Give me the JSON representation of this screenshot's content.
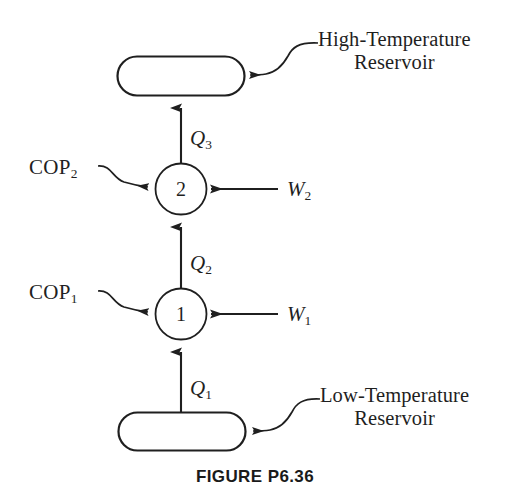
{
  "figure": {
    "caption": "FIGURE P6.36",
    "type": "thermodynamic-cycle-diagram",
    "background_color": "#ffffff",
    "line_color": "#1f1f1f"
  },
  "reservoirs": {
    "high": {
      "name": "high-temperature-reservoir",
      "line1": "High-Temperature",
      "line2": "Reservoir",
      "shape": "stadium"
    },
    "low": {
      "name": "low-temperature-reservoir",
      "line1": "Low-Temperature",
      "line2": "Reservoir",
      "shape": "stadium"
    }
  },
  "devices": [
    {
      "id": "device-2",
      "number": "2",
      "cop_prefix": "COP",
      "cop_sub": "2",
      "work_prefix": "W",
      "work_sub": "2"
    },
    {
      "id": "device-1",
      "number": "1",
      "cop_prefix": "COP",
      "cop_sub": "1",
      "work_prefix": "W",
      "work_sub": "1"
    }
  ],
  "heat_flows": [
    {
      "id": "q3",
      "prefix": "Q",
      "sub": "3",
      "from": "device-2",
      "to": "high-temperature-reservoir",
      "direction": "up"
    },
    {
      "id": "q2",
      "prefix": "Q",
      "sub": "2",
      "from": "device-1",
      "to": "device-2",
      "direction": "up"
    },
    {
      "id": "q1",
      "prefix": "Q",
      "sub": "1",
      "from": "low-temperature-reservoir",
      "to": "device-1",
      "direction": "up"
    }
  ]
}
